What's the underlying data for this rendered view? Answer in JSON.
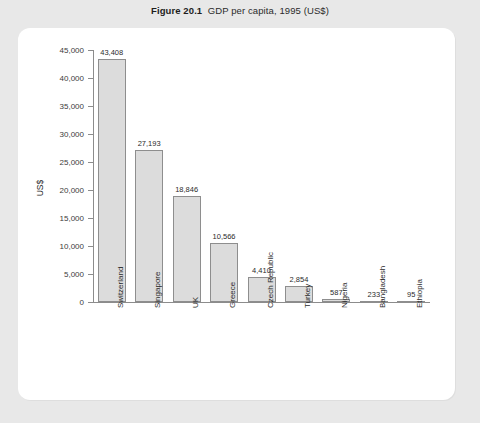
{
  "figure": {
    "number": "Figure 20.1",
    "caption": "GDP per capita, 1995 (US$)"
  },
  "chart_data": {
    "type": "bar",
    "xlabel": "",
    "ylabel": "US$",
    "ylim": [
      0,
      45000
    ],
    "ytick_step": 5000,
    "grid": false,
    "legend": false,
    "categories": [
      "Switzerland",
      "Singapore",
      "UK",
      "Greece",
      "Czech Republic",
      "Turkey",
      "Nigeria",
      "Bangladesh",
      "Ethiopia"
    ],
    "values": [
      43408,
      27193,
      18846,
      10566,
      4410,
      2854,
      587,
      233,
      95
    ],
    "value_labels": [
      "43,408",
      "27,193",
      "18,846",
      "10,566",
      "4,410",
      "2,854",
      "587",
      "233",
      "95"
    ],
    "ytick_labels": [
      "45,000",
      "40,000",
      "35,000",
      "30,000",
      "25,000",
      "20,000",
      "15,000",
      "10,000",
      "5,000",
      "0"
    ],
    "ytick_values": [
      45000,
      40000,
      35000,
      30000,
      25000,
      20000,
      15000,
      10000,
      5000,
      0
    ],
    "colors": {
      "bar_fill": "#dcdcdc",
      "bar_border": "#8e8e8e",
      "axis": "#8c8c8c",
      "text": "#2b2b2b",
      "card_background": "#ffffff",
      "page_background": "#e8e8e8"
    }
  }
}
